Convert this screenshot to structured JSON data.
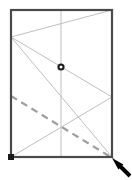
{
  "figure": {
    "title": "",
    "canvas": {
      "width": 132,
      "height": 180,
      "background": "#ffffff"
    },
    "colors": {
      "frame": "#4a4a4a",
      "construction_line": "#bfbfbf",
      "dashed_line": "#9e9e9e",
      "marker_dark": "#1a1a1a",
      "marker_fill": "#ffffff",
      "arrow": "#000000"
    },
    "frame": {
      "label": "rectangular-frame",
      "x": 11,
      "y": 10,
      "width": 101,
      "height": 147,
      "stroke_width": 2.2
    },
    "center_line": {
      "label": "vertical-center-line",
      "x": 61,
      "y_top": 10,
      "y_bottom": 157,
      "stroke_width": 1
    },
    "zigzag": {
      "label": "zigzag-construction-polyline",
      "points": "112,10 11,37 112,97 11,157",
      "stroke_width": 1
    },
    "zigzag_branch": {
      "label": "zigzag-branch-line",
      "x1": 11,
      "y1": 37,
      "x2": 112,
      "y2": 157,
      "stroke_width": 1
    },
    "dashed_line": {
      "label": "dashed-diagonal-line",
      "x1": 11,
      "y1": 96,
      "x2": 114,
      "y2": 159,
      "stroke_width": 2.2,
      "dash_pattern": "7 5"
    },
    "center_marker": {
      "label": "center-node-circle",
      "cx": 61,
      "cy": 67,
      "r_outer": 3.6,
      "r_inner": 1.5
    },
    "corner_marker": {
      "label": "bottom-left-square-node",
      "cx": 11,
      "cy": 157,
      "size": 6
    },
    "arrow": {
      "label": "pointer-arrow",
      "tip_x": 112,
      "tip_y": 158,
      "tail_x": 130,
      "tail_y": 176,
      "head_width": 7,
      "shaft_width": 3
    }
  }
}
